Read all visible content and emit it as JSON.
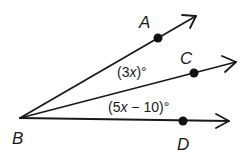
{
  "diagram": {
    "type": "angle-rays",
    "vertex": {
      "label": "B",
      "x": 20,
      "y": 118
    },
    "rays": [
      {
        "name": "BA",
        "point_label": "A",
        "point": {
          "x": 158,
          "y": 38
        },
        "tip": {
          "x": 196,
          "y": 16
        }
      },
      {
        "name": "BC",
        "point_label": "C",
        "point": {
          "x": 194,
          "y": 73
        },
        "tip": {
          "x": 236,
          "y": 62
        }
      },
      {
        "name": "BD",
        "point_label": "D",
        "point": {
          "x": 183,
          "y": 121
        },
        "tip": {
          "x": 229,
          "y": 121
        }
      }
    ],
    "labels": {
      "A": "A",
      "B": "B",
      "C": "C",
      "D": "D"
    },
    "angles": [
      {
        "name": "angle-ABC",
        "open": "(3",
        "var": "x",
        "close": ")°"
      },
      {
        "name": "angle-CBD",
        "open": "(5",
        "var": "x",
        "close": " − 10)°"
      }
    ],
    "colors": {
      "stroke": "#1a1a1a",
      "background": "#ffffff"
    }
  }
}
